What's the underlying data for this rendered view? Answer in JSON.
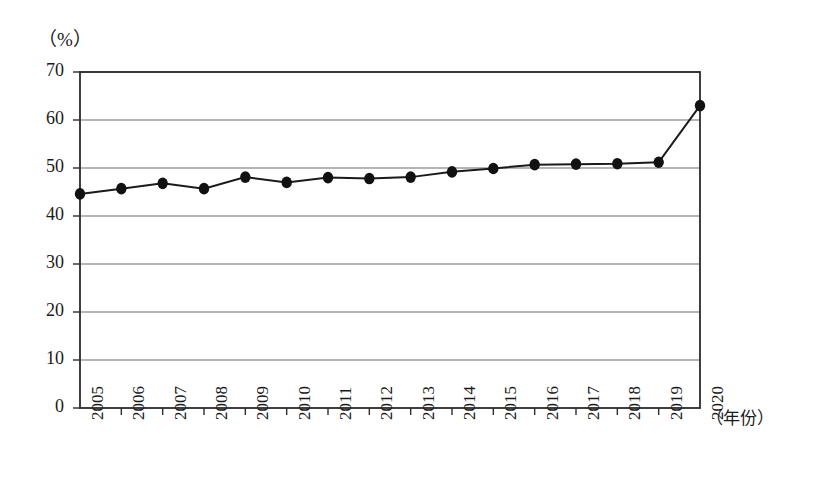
{
  "chart_data": {
    "type": "line",
    "title": "",
    "subtitle": "",
    "xlabel": "（年份）",
    "ylabel": "（%）",
    "categories": [
      "2005",
      "2006",
      "2007",
      "2008",
      "2009",
      "2010",
      "2011",
      "2012",
      "2013",
      "2014",
      "2015",
      "2016",
      "2017",
      "2018",
      "2019",
      "2020"
    ],
    "values": [
      44.6,
      45.7,
      46.8,
      45.7,
      48.1,
      47.0,
      48.0,
      47.8,
      48.1,
      49.2,
      49.9,
      50.7,
      50.8,
      50.9,
      51.2,
      63.0
    ],
    "series": [
      {
        "name": "",
        "values": [
          44.6,
          45.7,
          46.8,
          45.7,
          48.1,
          47.0,
          48.0,
          47.8,
          48.1,
          49.2,
          49.9,
          50.7,
          50.8,
          50.9,
          51.2,
          63.0
        ]
      }
    ],
    "ylim": [
      0,
      70
    ],
    "yticks": [
      0,
      10,
      20,
      30,
      40,
      50,
      60,
      70
    ],
    "ytick_labels": [
      "0",
      "10",
      "20",
      "30",
      "40",
      "50",
      "60",
      "70"
    ],
    "xtick_labels": [
      "2005",
      "2006",
      "2007",
      "2008",
      "2009",
      "2010",
      "2011",
      "2012",
      "2013",
      "2014",
      "2015",
      "2016",
      "2017",
      "2018",
      "2019",
      "2020"
    ],
    "grid": "horizontal",
    "legend": "none",
    "marker": "filled-circle",
    "line_color": "#1a1a1a",
    "marker_color": "#111111",
    "grid_color": "#6b6b6b",
    "axis_color": "#2b2b2b",
    "background_color": "#ffffff"
  },
  "axes": {
    "y_unit_label": "（%）",
    "x_unit_label": "（年份）"
  }
}
